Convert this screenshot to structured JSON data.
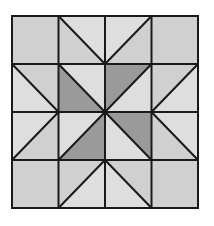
{
  "figure": {
    "type": "quilt-block",
    "grid": {
      "rows": 4,
      "cols": 4,
      "x_lines": [
        12,
        58.5,
        105,
        151.5,
        198
      ],
      "y_lines": [
        16,
        64,
        112,
        160,
        208
      ]
    },
    "colors": {
      "background": "#ffffff",
      "light": "#dedede",
      "medium": "#d0d0d0",
      "dark": "#9a9a9a",
      "line": "#1a1a1a"
    },
    "line_width": 2,
    "cells": [
      {
        "row": 0,
        "col": 0,
        "kind": "square",
        "fill": "medium"
      },
      {
        "row": 0,
        "col": 1,
        "kind": "split",
        "diagonal": "tl-br",
        "upper": "light",
        "lower": "medium"
      },
      {
        "row": 0,
        "col": 2,
        "kind": "split",
        "diagonal": "bl-tr",
        "upper": "light",
        "lower": "medium"
      },
      {
        "row": 0,
        "col": 3,
        "kind": "square",
        "fill": "medium"
      },
      {
        "row": 1,
        "col": 0,
        "kind": "split",
        "diagonal": "tl-br",
        "upper": "medium",
        "lower": "light"
      },
      {
        "row": 1,
        "col": 1,
        "kind": "split",
        "diagonal": "tl-br",
        "upper": "light",
        "lower": "dark"
      },
      {
        "row": 1,
        "col": 2,
        "kind": "split",
        "diagonal": "bl-tr",
        "upper": "dark",
        "lower": "light"
      },
      {
        "row": 1,
        "col": 3,
        "kind": "split",
        "diagonal": "bl-tr",
        "upper": "medium",
        "lower": "light"
      },
      {
        "row": 2,
        "col": 0,
        "kind": "split",
        "diagonal": "bl-tr",
        "upper": "light",
        "lower": "medium"
      },
      {
        "row": 2,
        "col": 1,
        "kind": "split",
        "diagonal": "bl-tr",
        "upper": "light",
        "lower": "dark"
      },
      {
        "row": 2,
        "col": 2,
        "kind": "split",
        "diagonal": "tl-br",
        "upper": "dark",
        "lower": "light"
      },
      {
        "row": 2,
        "col": 3,
        "kind": "split",
        "diagonal": "tl-br",
        "upper": "light",
        "lower": "medium"
      },
      {
        "row": 3,
        "col": 0,
        "kind": "square",
        "fill": "medium"
      },
      {
        "row": 3,
        "col": 1,
        "kind": "split",
        "diagonal": "bl-tr",
        "upper": "medium",
        "lower": "light"
      },
      {
        "row": 3,
        "col": 2,
        "kind": "split",
        "diagonal": "tl-br",
        "upper": "medium",
        "lower": "light"
      },
      {
        "row": 3,
        "col": 3,
        "kind": "square",
        "fill": "medium"
      }
    ]
  }
}
